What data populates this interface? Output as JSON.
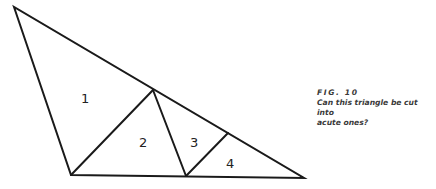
{
  "figure": {
    "caption_label": "FIG. 10",
    "caption_line1": "Can this triangle be cut into",
    "caption_line2": "acute ones?",
    "region_labels": [
      "1",
      "2",
      "3",
      "4"
    ],
    "line_color": "#1a1a1a",
    "caption_color": "#3a3a3a"
  }
}
